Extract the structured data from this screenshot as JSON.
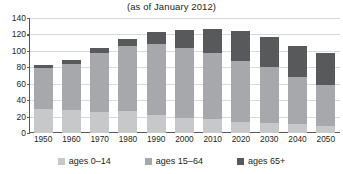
{
  "chart_title": "(as of January 2012)",
  "chart_data": {
    "type": "bar",
    "title": "(as of January 2012)",
    "xlabel": "",
    "ylabel": "",
    "ylim": [
      0,
      140
    ],
    "yticks": [
      0,
      20,
      40,
      60,
      80,
      100,
      120,
      140
    ],
    "grid": true,
    "stacked": true,
    "legend_position": "bottom",
    "categories": [
      "1950",
      "1960",
      "1970",
      "1980",
      "1990",
      "2000",
      "2010",
      "2020",
      "2030",
      "2040",
      "2050"
    ],
    "series": [
      {
        "name": "ages 0–14",
        "color": "#c7c8ca",
        "values": [
          29,
          28,
          25,
          27,
          22,
          18,
          17,
          14,
          12,
          11,
          9
        ]
      },
      {
        "name": "ages 15–64",
        "color": "#a6a8ab",
        "values": [
          50,
          56,
          72,
          79,
          86,
          86,
          81,
          74,
          68,
          57,
          50
        ]
      },
      {
        "name": "ages 65+",
        "color": "#58595b",
        "values": [
          4,
          5,
          7,
          9,
          15,
          22,
          29,
          36,
          37,
          38,
          38
        ]
      }
    ],
    "totals": [
      83,
      89,
      104,
      115,
      123,
      126,
      127,
      124,
      117,
      106,
      97
    ]
  },
  "yaxis": {
    "ticks": [
      {
        "value": 140,
        "label": "140"
      },
      {
        "value": 120,
        "label": "120"
      },
      {
        "value": 100,
        "label": "100"
      },
      {
        "value": 80,
        "label": "80"
      },
      {
        "value": 60,
        "label": "60"
      },
      {
        "value": 40,
        "label": "40"
      },
      {
        "value": 20,
        "label": "20"
      },
      {
        "value": 0,
        "label": "0"
      }
    ]
  },
  "legend": {
    "items": [
      {
        "label": "ages 0–14",
        "key": "young"
      },
      {
        "label": "ages 15–64",
        "key": "work"
      },
      {
        "label": "ages 65+",
        "key": "old"
      }
    ]
  },
  "colors": {
    "young": "#c7c8ca",
    "work": "#a6a8ab",
    "old": "#58595b",
    "axis": "#58595b",
    "grid": "#d9d9d9",
    "text": "#231f20",
    "background": "#ffffff"
  }
}
